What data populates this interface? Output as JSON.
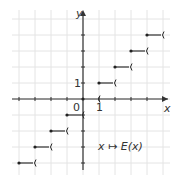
{
  "chart_data": {
    "type": "line",
    "title": "",
    "subtitle": "",
    "xlabel": "x",
    "ylabel": "y",
    "function_label": "x ↦ E(x)",
    "xlim": [
      -4,
      5
    ],
    "ylim": [
      -4,
      5
    ],
    "grid": true,
    "legend_position": "none",
    "tick_labels": {
      "origin": "0",
      "x_one": "1",
      "y_one": "1"
    },
    "steps": [
      {
        "x_start": -4,
        "x_end": -3,
        "y": -4
      },
      {
        "x_start": -3,
        "x_end": -2,
        "y": -3
      },
      {
        "x_start": -2,
        "x_end": -1,
        "y": -2
      },
      {
        "x_start": -1,
        "x_end": 0,
        "y": -1
      },
      {
        "x_start": 0,
        "x_end": 1,
        "y": 0
      },
      {
        "x_start": 1,
        "x_end": 2,
        "y": 1
      },
      {
        "x_start": 2,
        "x_end": 3,
        "y": 2
      },
      {
        "x_start": 3,
        "x_end": 4,
        "y": 3
      },
      {
        "x_start": 4,
        "x_end": 5,
        "y": 4
      }
    ],
    "colors": {
      "axis": "#333333",
      "grid": "#e4e4e4",
      "step": "#222222"
    }
  }
}
